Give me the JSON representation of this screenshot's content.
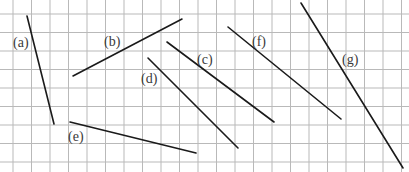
{
  "diagram": {
    "type": "grid-line-segments",
    "background": "#ffffff",
    "grid": {
      "color": "#b9b9b9",
      "x_lines": [
        13,
        31.5,
        50,
        68.5,
        87,
        105.5,
        124,
        142.5,
        161,
        179.5,
        198,
        216.5,
        235,
        253.5,
        272,
        290.5,
        309,
        327.5,
        346,
        364.5,
        383,
        401.5
      ],
      "y_lines": [
        14,
        32.5,
        51,
        69.5,
        88,
        106.5,
        125,
        143.5,
        162
      ]
    },
    "segment_color": "#1a1a1a",
    "segments": [
      {
        "id": "a",
        "label": "(a)",
        "x1": 27,
        "y1": 16,
        "x2": 54,
        "y2": 124,
        "label_x": 13,
        "label_y": 47
      },
      {
        "id": "b",
        "label": "(b)",
        "x1": 73,
        "y1": 76,
        "x2": 182,
        "y2": 19,
        "label_x": 104,
        "label_y": 46
      },
      {
        "id": "c",
        "label": "(c)",
        "x1": 167,
        "y1": 42,
        "x2": 274,
        "y2": 122,
        "label_x": 197,
        "label_y": 64
      },
      {
        "id": "d",
        "label": "(d)",
        "x1": 148,
        "y1": 58,
        "x2": 238,
        "y2": 148,
        "label_x": 141,
        "label_y": 83
      },
      {
        "id": "e",
        "label": "(e)",
        "x1": 70,
        "y1": 122,
        "x2": 196,
        "y2": 153,
        "label_x": 68,
        "label_y": 141
      },
      {
        "id": "f",
        "label": "(f)",
        "x1": 228,
        "y1": 27,
        "x2": 341,
        "y2": 119,
        "label_x": 252,
        "label_y": 46
      },
      {
        "id": "g",
        "label": "(g)",
        "x1": 301,
        "y1": 3,
        "x2": 403,
        "y2": 168,
        "label_x": 342,
        "label_y": 64
      }
    ]
  }
}
